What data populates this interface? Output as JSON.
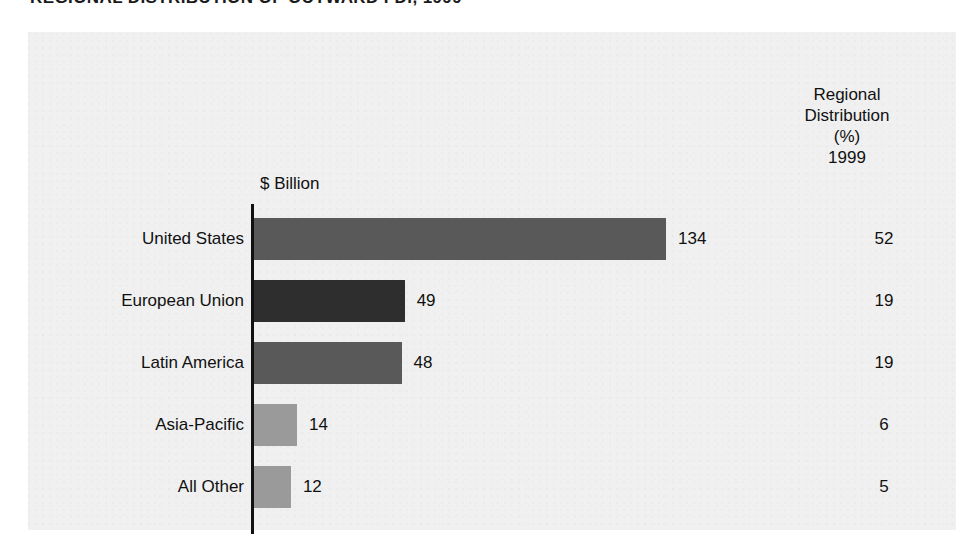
{
  "title": "REGIONAL DISTRIBUTION OF OUTWARD FDI, 1999",
  "axis_caption": "$ Billion",
  "right_header": {
    "line1": "Regional",
    "line2": "Distribution",
    "line3": "(%)",
    "line4": "1999"
  },
  "colors": {
    "panel_background": "#f0f0f0",
    "axis": "#111111",
    "bar_medium": "#595959",
    "bar_dark": "#2e2e2e",
    "bar_light": "#9a9a9a",
    "text": "#111111"
  },
  "chart_data": {
    "type": "bar",
    "orientation": "horizontal",
    "title": "REGIONAL DISTRIBUTION OF OUTWARD FDI, 1999",
    "xlabel": "$ Billion",
    "ylabel": "",
    "xlim": [
      0,
      134
    ],
    "grid": false,
    "legend": "none",
    "categories": [
      "United States",
      "European Union",
      "Latin America",
      "Asia-Pacific",
      "All Other"
    ],
    "values": [
      134,
      49,
      48,
      14,
      12
    ],
    "value_labels": [
      "134",
      "49",
      "48",
      "14",
      "12"
    ],
    "bar_colors": [
      "#595959",
      "#2e2e2e",
      "#595959",
      "#9a9a9a",
      "#9a9a9a"
    ],
    "secondary_column": {
      "header": "Regional Distribution (%) 1999",
      "unit": "%",
      "values": [
        52,
        19,
        19,
        6,
        5
      ],
      "value_labels": [
        "52",
        "19",
        "19",
        "6",
        "5"
      ]
    },
    "rows": [
      {
        "category": "United States",
        "value": 134,
        "value_label": "134",
        "pct": 52,
        "pct_label": "52",
        "shade": "shade-dark"
      },
      {
        "category": "European Union",
        "value": 49,
        "value_label": "49",
        "pct": 19,
        "pct_label": "19",
        "shade": "shade-darker"
      },
      {
        "category": "Latin America",
        "value": 48,
        "value_label": "48",
        "pct": 19,
        "pct_label": "19",
        "shade": "shade-dark"
      },
      {
        "category": "Asia-Pacific",
        "value": 14,
        "value_label": "14",
        "pct": 6,
        "pct_label": "6",
        "shade": "shade-light"
      },
      {
        "category": "All Other",
        "value": 12,
        "value_label": "12",
        "pct": 5,
        "pct_label": "5",
        "shade": "shade-light"
      }
    ]
  }
}
